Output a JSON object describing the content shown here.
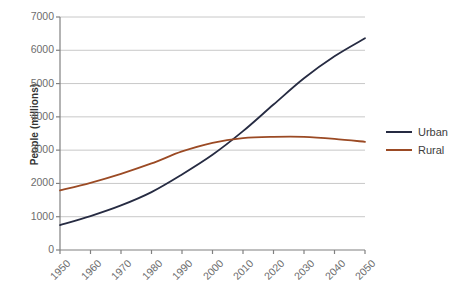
{
  "chart_data": {
    "type": "line",
    "title": "",
    "xlabel": "",
    "ylabel": "People (millions)",
    "xlim": [
      1950,
      2050
    ],
    "ylim": [
      0,
      7000
    ],
    "grid": true,
    "legend_position": "right",
    "x": [
      1950,
      1960,
      1970,
      1980,
      1990,
      2000,
      2010,
      2020,
      2030,
      2040,
      2050
    ],
    "categories": [
      "1950",
      "1960",
      "1970",
      "1980",
      "1990",
      "2000",
      "2010",
      "2020",
      "2030",
      "2040",
      "2050"
    ],
    "y_ticks": [
      0,
      1000,
      2000,
      3000,
      4000,
      5000,
      6000,
      7000
    ],
    "y_tick_labels": [
      "0",
      "1000",
      "2000",
      "3000",
      "4000",
      "5000",
      "6000",
      "7000"
    ],
    "series": [
      {
        "name": "Urban",
        "color": "#262b42",
        "values": [
          750,
          1020,
          1340,
          1740,
          2270,
          2860,
          3570,
          4370,
          5160,
          5820,
          6360
        ]
      },
      {
        "name": "Rural",
        "color": "#9b4a24",
        "values": [
          1790,
          2020,
          2290,
          2600,
          2960,
          3220,
          3360,
          3400,
          3400,
          3340,
          3250
        ]
      }
    ]
  },
  "axes": {
    "axis_color": "#808080",
    "grid_color": "#c8c8c8",
    "tick_label_color": "#6d6d6d",
    "title_color": "#333333"
  },
  "legend": {
    "items": [
      {
        "label": "Urban",
        "color": "#262b42"
      },
      {
        "label": "Rural",
        "color": "#9b4a24"
      }
    ]
  }
}
